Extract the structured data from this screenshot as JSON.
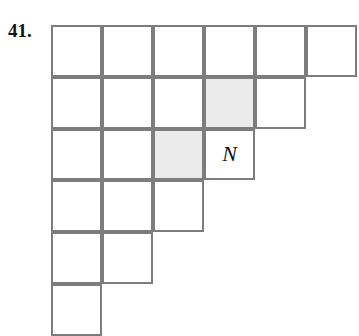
{
  "figure": {
    "problem_number": "41.",
    "colors": {
      "grid_line": "#7d7d7d",
      "cell_fill": "#ffffff",
      "shaded_fill": "#ebebeb",
      "text": "#141414",
      "background": "#ffffff"
    },
    "geometry": {
      "origin_x": 51,
      "origin_y": 25,
      "cell_width": 51,
      "cell_height": 51.8,
      "line_width": 2
    },
    "grid": {
      "shape": "staircase",
      "row_count": 6,
      "row_lengths": [
        6,
        5,
        4,
        3,
        2,
        1
      ],
      "cells": [
        {
          "row": 1,
          "col": 1,
          "shaded": false,
          "label": ""
        },
        {
          "row": 1,
          "col": 2,
          "shaded": false,
          "label": ""
        },
        {
          "row": 1,
          "col": 3,
          "shaded": false,
          "label": ""
        },
        {
          "row": 1,
          "col": 4,
          "shaded": false,
          "label": ""
        },
        {
          "row": 1,
          "col": 5,
          "shaded": false,
          "label": ""
        },
        {
          "row": 1,
          "col": 6,
          "shaded": false,
          "label": ""
        },
        {
          "row": 2,
          "col": 1,
          "shaded": false,
          "label": ""
        },
        {
          "row": 2,
          "col": 2,
          "shaded": false,
          "label": ""
        },
        {
          "row": 2,
          "col": 3,
          "shaded": false,
          "label": ""
        },
        {
          "row": 2,
          "col": 4,
          "shaded": true,
          "label": ""
        },
        {
          "row": 2,
          "col": 5,
          "shaded": false,
          "label": ""
        },
        {
          "row": 3,
          "col": 1,
          "shaded": false,
          "label": ""
        },
        {
          "row": 3,
          "col": 2,
          "shaded": false,
          "label": ""
        },
        {
          "row": 3,
          "col": 3,
          "shaded": true,
          "label": ""
        },
        {
          "row": 3,
          "col": 4,
          "shaded": false,
          "label": "N"
        },
        {
          "row": 4,
          "col": 1,
          "shaded": false,
          "label": ""
        },
        {
          "row": 4,
          "col": 2,
          "shaded": false,
          "label": ""
        },
        {
          "row": 4,
          "col": 3,
          "shaded": false,
          "label": ""
        },
        {
          "row": 5,
          "col": 1,
          "shaded": false,
          "label": ""
        },
        {
          "row": 5,
          "col": 2,
          "shaded": false,
          "label": ""
        },
        {
          "row": 6,
          "col": 1,
          "shaded": false,
          "label": ""
        }
      ]
    }
  }
}
